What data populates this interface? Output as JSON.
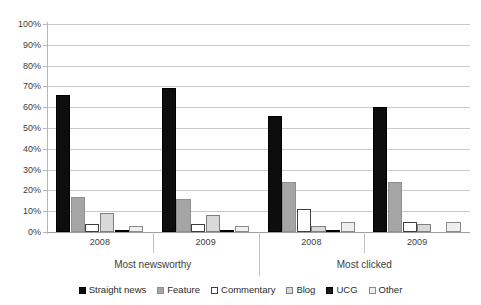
{
  "chart_data": {
    "type": "bar",
    "title": "",
    "subtitle": "",
    "xlabel": "",
    "ylabel": "",
    "ylim": [
      0,
      100
    ],
    "y_unit": "%",
    "grid": true,
    "legend_position": "bottom",
    "y_ticks": [
      "0%",
      "10%",
      "20%",
      "30%",
      "40%",
      "50%",
      "60%",
      "70%",
      "80%",
      "90%",
      "100%"
    ],
    "y_tick_values": [
      0,
      10,
      20,
      30,
      40,
      50,
      60,
      70,
      80,
      90,
      100
    ],
    "categories": [
      "2008",
      "2009",
      "2008",
      "2009"
    ],
    "supercategories": [
      {
        "label": "Most newsworthy",
        "span": 2
      },
      {
        "label": "Most clicked",
        "span": 2
      }
    ],
    "series": [
      {
        "name": "Straight news",
        "color": "#0d0d0d",
        "values": [
          66,
          69,
          56,
          60
        ]
      },
      {
        "name": "Feature",
        "color": "#a5a5a5",
        "values": [
          17,
          16,
          24,
          24
        ]
      },
      {
        "name": "Commentary",
        "color": "#ffffff",
        "values": [
          4,
          4,
          11,
          5
        ]
      },
      {
        "name": "Blog",
        "color": "#d9d9d9",
        "values": [
          9,
          8,
          3,
          4
        ]
      },
      {
        "name": "UCG",
        "color": "#1a1a1a",
        "values": [
          1,
          1,
          1,
          0
        ]
      },
      {
        "name": "Other",
        "color": "#efefef",
        "values": [
          3,
          3,
          5,
          5
        ]
      }
    ],
    "legend": [
      "Straight news",
      "Feature",
      "Commentary",
      "Blog",
      "UCG",
      "Other"
    ]
  }
}
